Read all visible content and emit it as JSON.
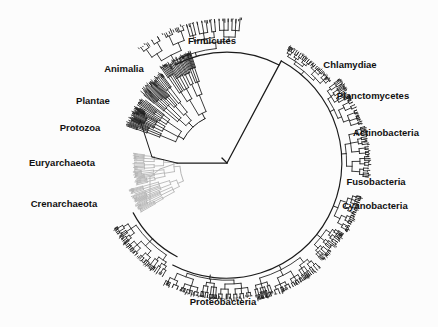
{
  "figure": {
    "type": "circular-phylogenetic-tree",
    "background_color": "#fcfcfc",
    "branch_color_primary": "#1a1a1a",
    "branch_color_secondary": "#b4b4b4",
    "label_color": "#111111",
    "width": 438,
    "height": 327,
    "center": {
      "x": 227,
      "y": 163
    },
    "root_node": {
      "x": 227,
      "y": 163
    }
  },
  "chart_data": {
    "type": "tree",
    "title": "",
    "xlabel": "",
    "ylabel": "",
    "legend": [],
    "center": {
      "x": 227,
      "y": 163
    },
    "ring_radius": 118,
    "clades": [
      {
        "name": "Firmicutes",
        "label_x": 212,
        "label_y": 44,
        "anchor": "middle",
        "angle_deg": 285,
        "color": "#1a1a1a",
        "domain": "Bacteria"
      },
      {
        "name": "Chlamydiae",
        "label_x": 350,
        "label_y": 68,
        "anchor": "middle",
        "angle_deg": 325,
        "color": "#1a1a1a",
        "domain": "Bacteria"
      },
      {
        "name": "Planctomycetes",
        "label_x": 373,
        "label_y": 99,
        "anchor": "middle",
        "angle_deg": 340,
        "color": "#1a1a1a",
        "domain": "Bacteria"
      },
      {
        "name": "Actinobacteria",
        "label_x": 386,
        "label_y": 136,
        "anchor": "middle",
        "angle_deg": 357,
        "color": "#1a1a1a",
        "domain": "Bacteria"
      },
      {
        "name": "Fusobacteria",
        "label_x": 376,
        "label_y": 185,
        "anchor": "middle",
        "angle_deg": 20,
        "color": "#1a1a1a",
        "domain": "Bacteria"
      },
      {
        "name": "Cyanobacteria",
        "label_x": 375,
        "label_y": 209,
        "anchor": "middle",
        "angle_deg": 32,
        "color": "#1a1a1a",
        "domain": "Bacteria"
      },
      {
        "name": "Proteobacteria",
        "label_x": 223,
        "label_y": 305,
        "anchor": "middle",
        "angle_deg": 95,
        "color": "#1a1a1a",
        "domain": "Bacteria"
      },
      {
        "name": "Crenarchaeota",
        "label_x": 64,
        "label_y": 207,
        "anchor": "middle",
        "angle_deg": 160,
        "color": "#b4b4b4",
        "domain": "Archaea"
      },
      {
        "name": "Euryarchaeota",
        "label_x": 62,
        "label_y": 166,
        "anchor": "middle",
        "angle_deg": 178,
        "color": "#b4b4b4",
        "domain": "Archaea"
      },
      {
        "name": "Protozoa",
        "label_x": 80,
        "label_y": 131,
        "anchor": "middle",
        "angle_deg": 196,
        "color": "#1a1a1a",
        "domain": "Eukaryota"
      },
      {
        "name": "Plantae",
        "label_x": 93,
        "label_y": 104,
        "anchor": "middle",
        "angle_deg": 212,
        "color": "#1a1a1a",
        "domain": "Eukaryota"
      },
      {
        "name": "Animalia",
        "label_x": 124,
        "label_y": 72,
        "anchor": "middle",
        "angle_deg": 228,
        "color": "#1a1a1a",
        "domain": "Eukaryota"
      }
    ]
  }
}
